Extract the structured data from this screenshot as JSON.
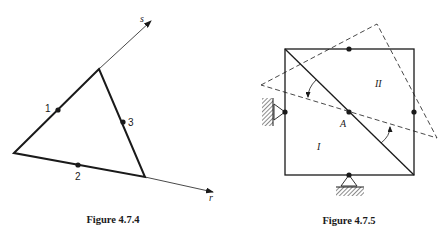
{
  "figures": [
    {
      "caption": "Figure 4.7.4",
      "axes": {
        "s_label": "s",
        "r_label": "r"
      },
      "nodes": [
        {
          "label": "1"
        },
        {
          "label": "2"
        },
        {
          "label": "3"
        }
      ]
    },
    {
      "caption": "Figure 4.7.5",
      "point_label": "A",
      "regions": [
        {
          "label": "I"
        },
        {
          "label": "II"
        }
      ]
    }
  ],
  "colors": {
    "ink": "#1a1a1a",
    "background": "#ffffff"
  }
}
